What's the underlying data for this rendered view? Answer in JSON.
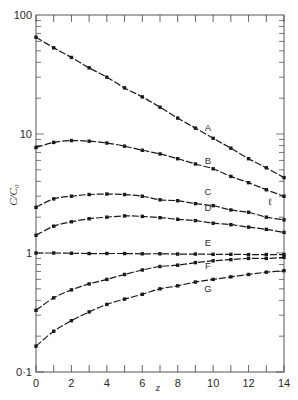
{
  "chart_data": {
    "type": "line",
    "title": "",
    "xlabel": "z",
    "ylabel": "C/C₀",
    "xlim": [
      0,
      14
    ],
    "ylim": [
      0.1,
      100
    ],
    "yscale": "log",
    "grid": false,
    "legend": "inline labels near curves",
    "x": [
      0,
      1,
      2,
      3,
      4,
      5,
      6,
      7,
      8,
      9,
      10,
      11,
      12,
      13,
      14
    ],
    "x_ticks": [
      0,
      2,
      4,
      6,
      8,
      10,
      12,
      14
    ],
    "x_tick_labels": [
      "0",
      "2",
      "4",
      "6",
      "8",
      "10",
      "12",
      "14"
    ],
    "y_ticks": [
      0.1,
      1,
      10,
      100
    ],
    "y_tick_labels": [
      "0·1",
      "1",
      "10",
      "100"
    ],
    "series": [
      {
        "name": "A",
        "values": [
          65,
          53,
          44,
          36,
          30,
          24.4,
          20.5,
          16.8,
          13.6,
          11.2,
          9.2,
          7.6,
          6.2,
          5.2,
          4.3
        ],
        "label_pos": [
          9.7,
          10.5
        ]
      },
      {
        "name": "B",
        "values": [
          7.7,
          8.5,
          8.8,
          8.7,
          8.4,
          7.9,
          7.3,
          6.8,
          6.2,
          5.6,
          5.1,
          4.4,
          3.9,
          3.4,
          3.0
        ],
        "label_pos": [
          9.7,
          5.6
        ]
      },
      {
        "name": "C",
        "values": [
          2.42,
          2.85,
          3.0,
          3.1,
          3.13,
          3.1,
          3.0,
          2.8,
          2.75,
          2.6,
          2.5,
          2.3,
          2.2,
          2.0,
          1.9
        ],
        "label_pos": [
          9.7,
          3.05
        ]
      },
      {
        "name": "D",
        "values": [
          1.41,
          1.68,
          1.83,
          1.94,
          2.0,
          2.05,
          2.03,
          1.98,
          1.92,
          1.87,
          1.78,
          1.73,
          1.65,
          1.58,
          1.49
        ],
        "label_pos": [
          9.7,
          2.25
        ]
      },
      {
        "name": "E",
        "values": [
          1.0,
          1.0,
          0.995,
          0.99,
          0.99,
          0.99,
          0.985,
          0.985,
          0.98,
          0.98,
          0.975,
          0.975,
          0.97,
          0.97,
          0.97
        ],
        "label_pos": [
          9.7,
          1.15
        ]
      },
      {
        "name": "F",
        "values": [
          0.33,
          0.42,
          0.49,
          0.55,
          0.6,
          0.66,
          0.72,
          0.77,
          0.79,
          0.83,
          0.86,
          0.88,
          0.9,
          0.9,
          0.92
        ],
        "label_pos": [
          9.7,
          0.73
        ]
      },
      {
        "name": "G",
        "values": [
          0.165,
          0.22,
          0.27,
          0.32,
          0.37,
          0.41,
          0.45,
          0.5,
          0.53,
          0.57,
          0.6,
          0.63,
          0.66,
          0.69,
          0.71
        ],
        "label_pos": [
          9.7,
          0.47
        ]
      }
    ],
    "annotations": [
      {
        "text": "ℓ",
        "x": 13.2,
        "y": 2.55
      }
    ]
  },
  "colors": {
    "ink": "#1a1a1a",
    "axis": "#555555",
    "background": "#ffffff"
  }
}
